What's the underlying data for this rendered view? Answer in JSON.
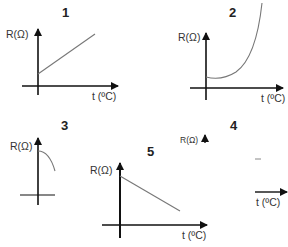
{
  "header": {
    "clipped_text": ""
  },
  "graphs": [
    {
      "id": "1",
      "number": "1",
      "ylabel": "R(Ω)",
      "xlabel": "t (ºC)",
      "shape": "increasing-linear"
    },
    {
      "id": "2",
      "number": "2",
      "ylabel": "R(Ω)",
      "xlabel": "t (ºC)",
      "shape": "increasing-exponential"
    },
    {
      "id": "3",
      "number": "3",
      "ylabel": "R(Ω)",
      "xlabel": "",
      "shape": "decreasing-curve-partial"
    },
    {
      "id": "4",
      "number": "4",
      "ylabel": "R(Ω)",
      "xlabel": "t (ºC)",
      "shape": "partial-axes"
    },
    {
      "id": "5",
      "number": "5",
      "ylabel": "R(Ω)",
      "xlabel": "t (ºC)",
      "shape": "decreasing-linear"
    }
  ],
  "colors": {
    "axis": "#111111",
    "curve": "#666666",
    "text": "#333333"
  }
}
